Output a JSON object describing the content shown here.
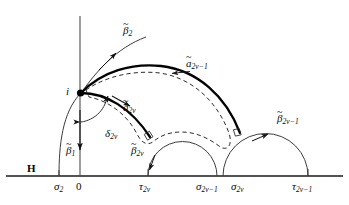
{
  "figure": {
    "plane_label": "H",
    "base_point_label": "i",
    "axis_ticks": [
      {
        "name": "sigma-2",
        "base": "σ",
        "sub": "2",
        "x": 59
      },
      {
        "name": "origin",
        "base": "0",
        "sub": "",
        "x": 80
      },
      {
        "name": "tau-2nu",
        "base": "τ",
        "sub": "2ν",
        "x": 148
      },
      {
        "name": "sigma-2nu-1",
        "base": "σ",
        "sub": "2ν−1",
        "x": 217
      },
      {
        "name": "sigma-2nu",
        "base": "σ",
        "sub": "2ν",
        "x": 223
      },
      {
        "name": "tau-2nu-1",
        "base": "τ",
        "sub": "2ν−1",
        "x": 308
      }
    ],
    "curve_labels": [
      {
        "name": "beta-tilde-2",
        "base": "β",
        "sub": "2",
        "accent": "~",
        "x": 123,
        "y": 25
      },
      {
        "name": "a-tilde-2nu-1",
        "base": "a",
        "sub": "2ν−1",
        "accent": "~",
        "x": 186,
        "y": 58
      },
      {
        "name": "a-tilde-2nu",
        "base": "a",
        "sub": "2ν",
        "accent": "~",
        "x": 123,
        "y": 102
      },
      {
        "name": "beta-tilde-2nu-1",
        "base": "β",
        "sub": "2ν−1",
        "accent": "~",
        "x": 277,
        "y": 113
      },
      {
        "name": "beta-tilde-2nu",
        "base": "β",
        "sub": "2ν",
        "accent": "~",
        "x": 131,
        "y": 145
      },
      {
        "name": "beta-tilde-1",
        "base": "β",
        "sub": "1",
        "accent": "~",
        "x": 66,
        "y": 145
      },
      {
        "name": "delta-2nu",
        "base": "δ",
        "sub": "2ν",
        "accent": "",
        "x": 105,
        "y": 128
      }
    ],
    "colors": {
      "ink": "#0b0b0b",
      "thin_stroke": "#3a3a3a",
      "thick_stroke": "#000000",
      "baseline": "#1a1a1a",
      "dashed_stroke": "#2b2b2b"
    },
    "geometry": {
      "baseline_y": 176,
      "vertical_axis_x": 80,
      "point_i_x": 80,
      "point_i_y": 93
    }
  }
}
